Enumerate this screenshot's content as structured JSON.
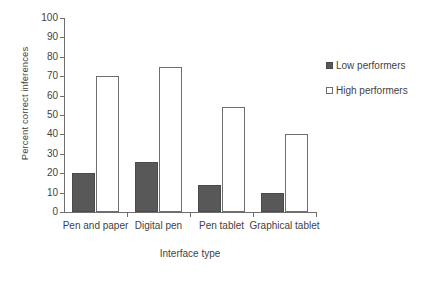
{
  "chart_data": {
    "type": "bar",
    "title": "",
    "xlabel": "Interface type",
    "ylabel": "Percent correct inferences",
    "categories": [
      "Pen and paper",
      "Digital pen",
      "Pen tablet",
      "Graphical tablet"
    ],
    "series": [
      {
        "name": "Low performers",
        "values": [
          20,
          26,
          14,
          10
        ],
        "color": "#585858",
        "fill": "solid"
      },
      {
        "name": "High performers",
        "values": [
          70,
          75,
          54,
          40
        ],
        "color": "#ffffff",
        "fill": "open"
      }
    ],
    "ylim": [
      0,
      100
    ],
    "ytick_labels": [
      "0",
      "10",
      "20",
      "30",
      "40",
      "50",
      "60",
      "70",
      "80",
      "90",
      "100"
    ],
    "ytick_values": [
      0,
      10,
      20,
      30,
      40,
      50,
      60,
      70,
      80,
      90,
      100
    ],
    "grid": false,
    "legend_position": "right"
  },
  "legend": {
    "entries": [
      {
        "label": "Low performers",
        "swatch": "filled-square-icon"
      },
      {
        "label": "High performers",
        "swatch": "open-square-icon"
      }
    ]
  }
}
